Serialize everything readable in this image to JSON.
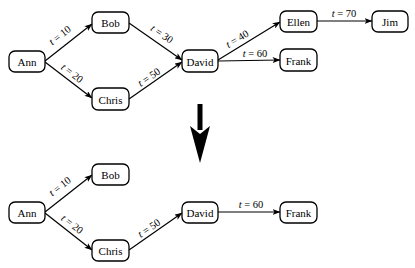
{
  "diagram": {
    "top_graph": {
      "nodes": [
        {
          "id": "ann",
          "label": "Ann",
          "x": 9,
          "y": 51,
          "w": 36,
          "h": 21
        },
        {
          "id": "bob",
          "label": "Bob",
          "x": 92,
          "y": 12,
          "w": 37,
          "h": 21
        },
        {
          "id": "chris",
          "label": "Chris",
          "x": 92,
          "y": 88,
          "w": 37,
          "h": 22
        },
        {
          "id": "david",
          "label": "David",
          "x": 182,
          "y": 50,
          "w": 36,
          "h": 22
        },
        {
          "id": "ellen",
          "label": "Ellen",
          "x": 280,
          "y": 11,
          "w": 37,
          "h": 21
        },
        {
          "id": "jim",
          "label": "Jim",
          "x": 372,
          "y": 11,
          "w": 36,
          "h": 21
        },
        {
          "id": "frank",
          "label": "Frank",
          "x": 280,
          "y": 49,
          "w": 37,
          "h": 22
        }
      ],
      "edges": [
        {
          "from": "ann",
          "to": "bob",
          "t": "10",
          "x1": 45,
          "y1": 61,
          "x2": 92,
          "y2": 24,
          "lx": 62,
          "ly": 38,
          "angle": -38
        },
        {
          "from": "ann",
          "to": "chris",
          "t": "20",
          "x1": 45,
          "y1": 62,
          "x2": 92,
          "y2": 98,
          "lx": 70,
          "ly": 76,
          "angle": 38
        },
        {
          "from": "bob",
          "to": "david",
          "t": "30",
          "x1": 129,
          "y1": 23,
          "x2": 182,
          "y2": 60,
          "lx": 160,
          "ly": 37,
          "angle": 34
        },
        {
          "from": "chris",
          "to": "david",
          "t": "50",
          "x1": 129,
          "y1": 99,
          "x2": 182,
          "y2": 62,
          "lx": 151,
          "ly": 80,
          "angle": -34
        },
        {
          "from": "david",
          "to": "ellen",
          "t": "40",
          "x1": 218,
          "y1": 60,
          "x2": 280,
          "y2": 22,
          "lx": 239,
          "ly": 42,
          "angle": -31
        },
        {
          "from": "david",
          "to": "frank",
          "t": "60",
          "x1": 218,
          "y1": 61,
          "x2": 280,
          "y2": 60,
          "lx": 255,
          "ly": 57,
          "angle": 0
        },
        {
          "from": "ellen",
          "to": "jim",
          "t": "70",
          "x1": 317,
          "y1": 21,
          "x2": 372,
          "y2": 21,
          "lx": 344,
          "ly": 17,
          "angle": 0
        }
      ]
    },
    "transition_arrow": {
      "label": "down-arrow",
      "x": 200,
      "y1": 104,
      "y2": 163
    },
    "bottom_graph": {
      "nodes": [
        {
          "id": "ann",
          "label": "Ann",
          "x": 9,
          "y": 202,
          "w": 36,
          "h": 21
        },
        {
          "id": "bob",
          "label": "Bob",
          "x": 92,
          "y": 164,
          "w": 37,
          "h": 21
        },
        {
          "id": "chris",
          "label": "Chris",
          "x": 92,
          "y": 240,
          "w": 37,
          "h": 21
        },
        {
          "id": "david",
          "label": "David",
          "x": 182,
          "y": 202,
          "w": 36,
          "h": 21
        },
        {
          "id": "frank",
          "label": "Frank",
          "x": 280,
          "y": 202,
          "w": 37,
          "h": 21
        }
      ],
      "edges": [
        {
          "from": "ann",
          "to": "bob",
          "t": "10",
          "x1": 45,
          "y1": 212,
          "x2": 92,
          "y2": 175,
          "lx": 62,
          "ly": 189,
          "angle": -38
        },
        {
          "from": "ann",
          "to": "chris",
          "t": "20",
          "x1": 45,
          "y1": 213,
          "x2": 92,
          "y2": 250,
          "lx": 70,
          "ly": 227,
          "angle": 38
        },
        {
          "from": "chris",
          "to": "david",
          "t": "50",
          "x1": 129,
          "y1": 250,
          "x2": 182,
          "y2": 213,
          "lx": 151,
          "ly": 231,
          "angle": -34
        },
        {
          "from": "david",
          "to": "frank",
          "t": "60",
          "x1": 218,
          "y1": 212,
          "x2": 280,
          "y2": 212,
          "lx": 251,
          "ly": 208,
          "angle": 0
        }
      ]
    },
    "label_prefix": "t",
    "label_op": " = "
  }
}
